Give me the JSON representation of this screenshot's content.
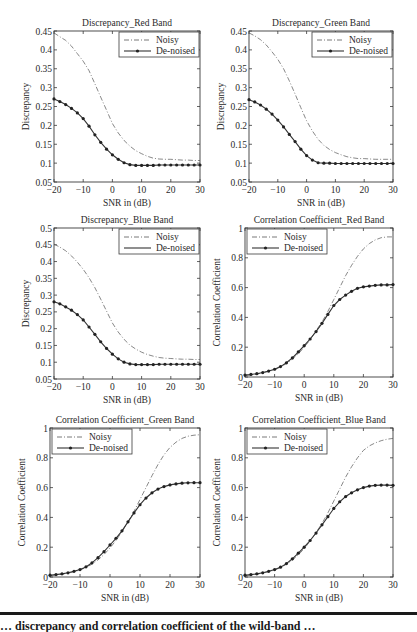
{
  "figure": {
    "caption_partial": "… discrepancy and correlation coefficient of the wild-band …"
  },
  "legend": {
    "noisy": "Noisy",
    "denoised": "De-noised"
  },
  "chart_data": [
    {
      "id": "p1",
      "type": "line",
      "title": "Discrepancy_Red Band",
      "xlabel": "SNR in (dB)",
      "ylabel": "Discrepancy",
      "xlim": [
        -20,
        30
      ],
      "ylim": [
        0.05,
        0.45
      ],
      "xticks": [
        -20,
        -10,
        0,
        10,
        20,
        30
      ],
      "yticks": [
        0.05,
        0.1,
        0.15,
        0.2,
        0.25,
        0.3,
        0.35,
        0.4,
        0.45
      ],
      "ytick_labels": [
        "0.05",
        "0.1",
        "0.15",
        "0.2",
        "0.25",
        "0.3",
        "0.35",
        "0.4",
        "0.45"
      ],
      "legend_position": "upper right",
      "grid": false,
      "box": [
        54,
        31,
        200,
        182
      ],
      "x": [
        -20,
        -18,
        -16,
        -14,
        -12,
        -10,
        -8,
        -6,
        -4,
        -2,
        0,
        2,
        4,
        6,
        8,
        10,
        12,
        14,
        16,
        18,
        20,
        22,
        24,
        26,
        28,
        30
      ],
      "series": [
        {
          "name": "Noisy",
          "style": "dashdot",
          "markers": false,
          "values": [
            0.445,
            0.435,
            0.425,
            0.41,
            0.39,
            0.37,
            0.345,
            0.31,
            0.275,
            0.24,
            0.205,
            0.18,
            0.16,
            0.145,
            0.133,
            0.125,
            0.118,
            0.113,
            0.111,
            0.11,
            0.11,
            0.109,
            0.108,
            0.108,
            0.107,
            0.107
          ]
        },
        {
          "name": "De-noised",
          "style": "solid",
          "markers": true,
          "values": [
            0.27,
            0.263,
            0.255,
            0.245,
            0.233,
            0.218,
            0.198,
            0.175,
            0.155,
            0.137,
            0.122,
            0.11,
            0.101,
            0.096,
            0.094,
            0.094,
            0.094,
            0.094,
            0.095,
            0.095,
            0.095,
            0.095,
            0.095,
            0.095,
            0.095,
            0.095
          ]
        }
      ]
    },
    {
      "id": "p2",
      "type": "line",
      "title": "Discrepancy_Green Band",
      "xlabel": "SNR in (dB)",
      "ylabel": "Discrepancy",
      "xlim": [
        -20,
        30
      ],
      "ylim": [
        0.05,
        0.45
      ],
      "xticks": [
        -20,
        -10,
        0,
        10,
        20,
        30
      ],
      "yticks": [
        0.05,
        0.1,
        0.15,
        0.2,
        0.25,
        0.3,
        0.35,
        0.4,
        0.45
      ],
      "ytick_labels": [
        "0.05",
        "0.1",
        "0.15",
        "0.2",
        "0.25",
        "0.3",
        "0.35",
        "0.4",
        "0.45"
      ],
      "legend_position": "upper right",
      "grid": false,
      "box": [
        249,
        31,
        393,
        182
      ],
      "x": [
        -20,
        -18,
        -16,
        -14,
        -12,
        -10,
        -8,
        -6,
        -4,
        -2,
        0,
        2,
        4,
        6,
        8,
        10,
        12,
        14,
        16,
        18,
        20,
        22,
        24,
        26,
        28,
        30
      ],
      "series": [
        {
          "name": "Noisy",
          "style": "dashdot",
          "markers": false,
          "values": [
            0.445,
            0.437,
            0.427,
            0.413,
            0.395,
            0.375,
            0.35,
            0.318,
            0.283,
            0.247,
            0.212,
            0.185,
            0.163,
            0.147,
            0.136,
            0.128,
            0.122,
            0.117,
            0.114,
            0.112,
            0.112,
            0.111,
            0.11,
            0.11,
            0.11,
            0.11
          ]
        },
        {
          "name": "De-noised",
          "style": "solid",
          "markers": true,
          "values": [
            0.268,
            0.262,
            0.254,
            0.243,
            0.23,
            0.214,
            0.196,
            0.176,
            0.157,
            0.137,
            0.12,
            0.108,
            0.101,
            0.1,
            0.1,
            0.099,
            0.099,
            0.099,
            0.099,
            0.099,
            0.099,
            0.099,
            0.099,
            0.099,
            0.099,
            0.099
          ]
        }
      ]
    },
    {
      "id": "p3",
      "type": "line",
      "title": "Discrepancy_Blue Band",
      "xlabel": "SNR in (dB)",
      "ylabel": "Discrepancy",
      "xlim": [
        -20,
        30
      ],
      "ylim": [
        0.05,
        0.5
      ],
      "xticks": [
        -20,
        -10,
        0,
        10,
        20,
        30
      ],
      "yticks": [
        0.05,
        0.1,
        0.15,
        0.2,
        0.25,
        0.3,
        0.35,
        0.4,
        0.45,
        0.5
      ],
      "ytick_labels": [
        "0.05",
        "0.1",
        "0.15",
        "0.2",
        "0.25",
        "0.3",
        "0.35",
        "0.4",
        "0.45",
        "0.5"
      ],
      "legend_position": "upper right",
      "grid": false,
      "box": [
        54,
        228,
        200,
        379
      ],
      "x": [
        -20,
        -18,
        -16,
        -14,
        -12,
        -10,
        -8,
        -6,
        -4,
        -2,
        0,
        2,
        4,
        6,
        8,
        10,
        12,
        14,
        16,
        18,
        20,
        22,
        24,
        26,
        28,
        30
      ],
      "series": [
        {
          "name": "Noisy",
          "style": "dashdot",
          "markers": false,
          "values": [
            0.452,
            0.443,
            0.432,
            0.417,
            0.398,
            0.377,
            0.352,
            0.322,
            0.288,
            0.252,
            0.217,
            0.19,
            0.168,
            0.151,
            0.139,
            0.13,
            0.123,
            0.118,
            0.114,
            0.112,
            0.111,
            0.11,
            0.109,
            0.109,
            0.108,
            0.108
          ]
        },
        {
          "name": "De-noised",
          "style": "solid",
          "markers": true,
          "values": [
            0.28,
            0.274,
            0.265,
            0.255,
            0.242,
            0.226,
            0.205,
            0.183,
            0.161,
            0.141,
            0.124,
            0.11,
            0.1,
            0.095,
            0.093,
            0.093,
            0.093,
            0.093,
            0.094,
            0.094,
            0.094,
            0.094,
            0.094,
            0.094,
            0.094,
            0.094
          ]
        }
      ]
    },
    {
      "id": "p4",
      "type": "line",
      "title": "Correlation Coefficient_Red Band",
      "xlabel": "SNR in (dB)",
      "ylabel": "Correlation Coefficient",
      "xlim": [
        -20,
        30
      ],
      "ylim": [
        0,
        1
      ],
      "xticks": [
        -20,
        -10,
        0,
        10,
        20,
        30
      ],
      "yticks": [
        0,
        0.2,
        0.4,
        0.6,
        0.8,
        1
      ],
      "ytick_labels": [
        "0",
        "0.2",
        "0.4",
        "0.6",
        "0.8",
        "1"
      ],
      "legend_position": "upper left",
      "grid": false,
      "box": [
        245,
        228,
        393,
        377
      ],
      "x": [
        -20,
        -18,
        -16,
        -14,
        -12,
        -10,
        -8,
        -6,
        -4,
        -2,
        0,
        2,
        4,
        6,
        8,
        10,
        12,
        14,
        16,
        18,
        20,
        22,
        24,
        26,
        28,
        30
      ],
      "series": [
        {
          "name": "Noisy",
          "style": "dashdot",
          "markers": false,
          "values": [
            0.01,
            0.015,
            0.02,
            0.028,
            0.037,
            0.05,
            0.068,
            0.09,
            0.12,
            0.155,
            0.2,
            0.25,
            0.31,
            0.37,
            0.44,
            0.52,
            0.6,
            0.68,
            0.75,
            0.81,
            0.86,
            0.895,
            0.92,
            0.935,
            0.94,
            0.94
          ]
        },
        {
          "name": "De-noised",
          "style": "solid",
          "markers": true,
          "values": [
            0.013,
            0.017,
            0.022,
            0.03,
            0.04,
            0.052,
            0.07,
            0.095,
            0.128,
            0.168,
            0.21,
            0.255,
            0.305,
            0.36,
            0.42,
            0.48,
            0.52,
            0.55,
            0.575,
            0.595,
            0.605,
            0.61,
            0.615,
            0.618,
            0.618,
            0.62
          ]
        }
      ]
    },
    {
      "id": "p5",
      "type": "line",
      "title": "Correlation Coefficient_Green Band",
      "xlabel": "SNR in (dB)",
      "ylabel": "Correlation Coefficient",
      "xlim": [
        -20,
        30
      ],
      "ylim": [
        0,
        1
      ],
      "xticks": [
        -20,
        -10,
        0,
        10,
        20,
        30
      ],
      "yticks": [
        0,
        0.2,
        0.4,
        0.6,
        0.8,
        1
      ],
      "ytick_labels": [
        "0",
        "0.2",
        "0.4",
        "0.6",
        "0.8",
        "1"
      ],
      "legend_position": "upper left",
      "grid": false,
      "box": [
        50,
        428,
        200,
        577
      ],
      "x": [
        -20,
        -18,
        -16,
        -14,
        -12,
        -10,
        -8,
        -6,
        -4,
        -2,
        0,
        2,
        4,
        6,
        8,
        10,
        12,
        14,
        16,
        18,
        20,
        22,
        24,
        26,
        28,
        30
      ],
      "series": [
        {
          "name": "Noisy",
          "style": "dashdot",
          "markers": false,
          "values": [
            0.01,
            0.014,
            0.019,
            0.026,
            0.035,
            0.047,
            0.064,
            0.086,
            0.115,
            0.15,
            0.195,
            0.245,
            0.305,
            0.37,
            0.44,
            0.52,
            0.6,
            0.68,
            0.755,
            0.82,
            0.87,
            0.905,
            0.93,
            0.945,
            0.952,
            0.955
          ]
        },
        {
          "name": "De-noised",
          "style": "solid",
          "markers": true,
          "values": [
            0.012,
            0.016,
            0.021,
            0.028,
            0.038,
            0.05,
            0.068,
            0.095,
            0.13,
            0.17,
            0.215,
            0.26,
            0.31,
            0.37,
            0.43,
            0.485,
            0.53,
            0.565,
            0.59,
            0.607,
            0.618,
            0.625,
            0.63,
            0.632,
            0.633,
            0.633
          ]
        }
      ]
    },
    {
      "id": "p6",
      "type": "line",
      "title": "Correlation Coefficient_Blue Band",
      "xlabel": "SNR in (dB)",
      "ylabel": "Correlation Coefficient",
      "xlim": [
        -20,
        30
      ],
      "ylim": [
        0,
        1
      ],
      "xticks": [
        -20,
        -10,
        0,
        10,
        20,
        30
      ],
      "yticks": [
        0,
        0.2,
        0.4,
        0.6,
        0.8,
        1
      ],
      "ytick_labels": [
        "0",
        "0.2",
        "0.4",
        "0.6",
        "0.8",
        "1"
      ],
      "legend_position": "upper left",
      "grid": false,
      "box": [
        245,
        428,
        393,
        577
      ],
      "x": [
        -20,
        -18,
        -16,
        -14,
        -12,
        -10,
        -8,
        -6,
        -4,
        -2,
        0,
        2,
        4,
        6,
        8,
        10,
        12,
        14,
        16,
        18,
        20,
        22,
        24,
        26,
        28,
        30
      ],
      "series": [
        {
          "name": "Noisy",
          "style": "dashdot",
          "markers": false,
          "values": [
            0.01,
            0.014,
            0.019,
            0.026,
            0.035,
            0.047,
            0.063,
            0.085,
            0.113,
            0.148,
            0.19,
            0.24,
            0.298,
            0.36,
            0.43,
            0.51,
            0.59,
            0.67,
            0.74,
            0.8,
            0.85,
            0.88,
            0.9,
            0.915,
            0.925,
            0.93
          ]
        },
        {
          "name": "De-noised",
          "style": "solid",
          "markers": true,
          "values": [
            0.012,
            0.016,
            0.021,
            0.028,
            0.038,
            0.05,
            0.066,
            0.09,
            0.122,
            0.16,
            0.2,
            0.245,
            0.295,
            0.35,
            0.405,
            0.46,
            0.505,
            0.54,
            0.565,
            0.585,
            0.6,
            0.61,
            0.615,
            0.617,
            0.617,
            0.615
          ]
        }
      ]
    }
  ]
}
